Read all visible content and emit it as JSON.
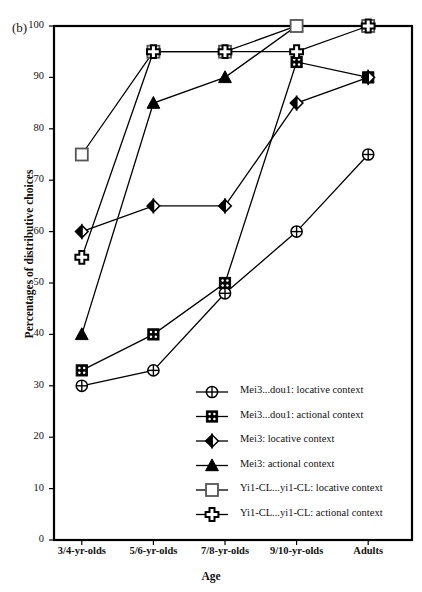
{
  "panel": {
    "label": "(b)"
  },
  "axes": {
    "ylabel": "Percentages of distributive choices",
    "xlabel": "Age",
    "yticks": [
      "0",
      "10",
      "20",
      "30",
      "40",
      "50",
      "60",
      "70",
      "80",
      "90",
      "100"
    ],
    "xticks": [
      "3/4-yr-olds",
      "5/6-yr-olds",
      "7/8-yr-olds",
      "9/10-yr-olds",
      "Adults"
    ]
  },
  "legend": {
    "items": [
      {
        "label": "Mei3...dou1: locative context",
        "marker": "circle-plus-marker"
      },
      {
        "label": "Mei3...dou1: actional context",
        "marker": "filled-square-dotted-marker"
      },
      {
        "label": "Mei3: locative context",
        "marker": "half-filled-diamond-marker"
      },
      {
        "label": "Mei3: actional context",
        "marker": "filled-triangle-marker"
      },
      {
        "label": "Yi1-CL...yi1-CL: locative context",
        "marker": "open-square-marker"
      },
      {
        "label": "Yi1-CL...yi1-CL: actional context",
        "marker": "cross-plus-marker"
      }
    ]
  },
  "chart_data": {
    "type": "line",
    "title": "",
    "xlabel": "Age",
    "ylabel": "Percentages of distributive choices",
    "categories": [
      "3/4-yr-olds",
      "5/6-yr-olds",
      "7/8-yr-olds",
      "9/10-yr-olds",
      "Adults"
    ],
    "ylim": [
      0,
      100
    ],
    "ytick_step": 10,
    "grid": false,
    "legend_position": "inside-bottom-right",
    "series": [
      {
        "name": "Mei3...dou1: locative context",
        "marker": "circle-plus",
        "values": [
          30,
          33,
          48,
          60,
          75
        ]
      },
      {
        "name": "Mei3...dou1: actional context",
        "marker": "filled-square-dotted",
        "values": [
          33,
          40,
          50,
          93,
          90
        ]
      },
      {
        "name": "Mei3: locative context",
        "marker": "half-filled-diamond",
        "values": [
          60,
          65,
          65,
          85,
          90
        ]
      },
      {
        "name": "Mei3: actional context",
        "marker": "filled-triangle",
        "values": [
          40,
          85,
          90,
          100,
          100
        ]
      },
      {
        "name": "Yi1-CL...yi1-CL: locative context",
        "marker": "open-square",
        "values": [
          75,
          95,
          95,
          100,
          100
        ]
      },
      {
        "name": "Yi1-CL...yi1-CL: actional context",
        "marker": "cross-plus",
        "values": [
          55,
          95,
          95,
          95,
          100
        ]
      }
    ]
  },
  "colors": {
    "ink": "#111111",
    "line": "#000000",
    "fill": "#ffffff"
  }
}
